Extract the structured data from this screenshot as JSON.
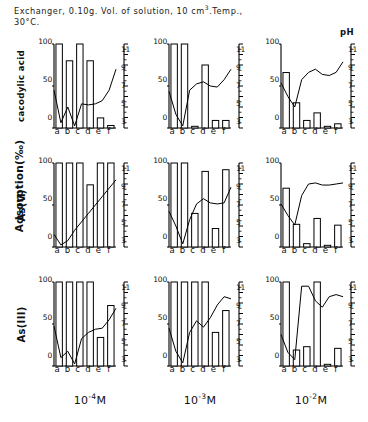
{
  "caption": {
    "line1": "Exchanger, 0.10g. Vol. of solution, 10 cm",
    "sup1": "3",
    "line1b": ".Temp.,",
    "line2": "30°C."
  },
  "axes": {
    "ph_axis_label": "pH",
    "y_axis_title": "Adsorption(‰)",
    "y_ticks": [
      "100",
      "50",
      "0"
    ],
    "ph_ticks": [
      "11",
      "9",
      "7",
      "5",
      "3"
    ],
    "x_ticks": [
      "a",
      "b",
      "c",
      "d",
      "e",
      "f"
    ]
  },
  "columns": [
    {
      "label": "10",
      "exponent": "-4",
      "unit": "M"
    },
    {
      "label": "10",
      "exponent": "-3",
      "unit": "M"
    },
    {
      "label": "10",
      "exponent": "-2",
      "unit": "M"
    }
  ],
  "rows": [
    {
      "label": "cacodylic acid"
    },
    {
      "label": "As(V)"
    },
    {
      "label": "As(III)"
    }
  ],
  "chart_data": {
    "type": "bar",
    "xlabel": "",
    "ylabel": "Adsorption(‰)",
    "ylim": [
      0,
      100
    ],
    "y2label": "pH",
    "y2lim": [
      3,
      11
    ],
    "grid": false,
    "legend": "none",
    "categories": [
      "a",
      "b",
      "c",
      "d",
      "e",
      "f"
    ],
    "panels": [
      {
        "row": "cacodylic acid",
        "column": "10-4M",
        "bars": [
          100,
          80,
          100,
          80,
          12,
          3
        ],
        "ph_line": [
          6.6,
          3.5,
          5.0,
          3.2,
          5.3,
          5.2,
          5.3,
          5.6,
          6.6,
          8.6
        ]
      },
      {
        "row": "cacodylic acid",
        "column": "10-3M",
        "bars": [
          100,
          100,
          2,
          75,
          9,
          9
        ],
        "ph_line": [
          6.5,
          4.3,
          3.2,
          6.6,
          7.2,
          7.4,
          7.0,
          6.9,
          7.6,
          8.6
        ]
      },
      {
        "row": "cacodylic acid",
        "column": "10-2M",
        "bars": [
          66,
          30,
          9,
          18,
          2,
          5
        ],
        "ph_line": [
          7.3,
          6.0,
          5.0,
          7.6,
          8.3,
          8.6,
          8.1,
          8.0,
          8.3,
          9.3
        ]
      },
      {
        "row": "As(V)",
        "column": "10-4M",
        "bars": [
          100,
          100,
          100,
          74,
          100,
          100
        ],
        "ph_line": [
          4.2,
          3.2,
          3.6,
          4.6,
          5.4,
          6.2,
          7.0,
          7.8,
          8.6,
          9.4
        ]
      },
      {
        "row": "As(V)",
        "column": "10-3M",
        "bars": [
          100,
          100,
          40,
          90,
          22,
          92
        ],
        "ph_line": [
          6.4,
          5.0,
          3.3,
          5.6,
          7.1,
          7.6,
          7.2,
          7.1,
          7.2,
          8.7
        ]
      },
      {
        "row": "As(V)",
        "column": "10-2M",
        "bars": [
          70,
          27,
          4,
          34,
          2,
          26
        ],
        "ph_line": [
          7.1,
          6.0,
          5.1,
          7.9,
          9.0,
          9.1,
          8.9,
          8.9,
          9.0,
          9.1
        ]
      },
      {
        "row": "As(III)",
        "column": "10-4M",
        "bars": [
          100,
          100,
          100,
          100,
          34,
          72
        ],
        "ph_line": [
          6.8,
          3.8,
          4.4,
          3.2,
          5.6,
          6.2,
          6.5,
          6.6,
          7.4,
          8.5
        ]
      },
      {
        "row": "As(III)",
        "column": "10-3M",
        "bars": [
          100,
          100,
          100,
          100,
          40,
          66
        ],
        "ph_line": [
          6.6,
          4.4,
          3.3,
          6.2,
          7.3,
          6.7,
          7.6,
          8.8,
          9.6,
          9.4
        ]
      },
      {
        "row": "As(III)",
        "column": "10-2M",
        "bars": [
          100,
          19,
          23,
          100,
          2,
          21
        ],
        "ph_line": [
          6.0,
          4.3,
          3.6,
          10.6,
          10.6,
          9.2,
          8.6,
          9.6,
          9.8,
          9.6
        ]
      }
    ]
  }
}
